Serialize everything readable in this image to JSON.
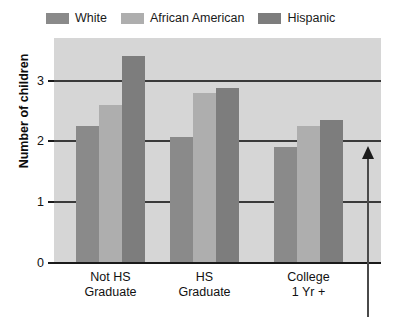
{
  "chart_data": {
    "type": "bar",
    "title": "",
    "subtitle": "",
    "xlabel": "",
    "ylabel": "Number of children",
    "categories": [
      "Not HS Graduate",
      "HS Graduate",
      "College 1 Yr +"
    ],
    "category_lines": [
      [
        "Not HS",
        "Graduate"
      ],
      [
        "HS",
        "Graduate"
      ],
      [
        "College",
        "1 Yr +"
      ]
    ],
    "series": [
      {
        "name": "White",
        "color": "#8a8a8a",
        "values": [
          2.25,
          2.08,
          1.9
        ]
      },
      {
        "name": "African American",
        "color": "#aeaeae",
        "values": [
          2.6,
          2.8,
          2.25
        ]
      },
      {
        "name": "Hispanic",
        "color": "#7d7d7d",
        "values": [
          3.4,
          2.87,
          2.35
        ]
      }
    ],
    "ylim": [
      0,
      3.7
    ],
    "yticks": [
      0,
      1,
      2,
      3
    ],
    "ytick_labels": [
      "0",
      "1",
      "2",
      "3"
    ],
    "grid": true,
    "grid_orientation": "horizontal",
    "legend_position": "top-left",
    "plot_background": "#d6d6d6",
    "annotations": [
      {
        "name": "upward-arrow",
        "type": "arrow",
        "direction": "up",
        "x_px": 368,
        "y_tip_px": 146,
        "y_tail_px": 317
      }
    ]
  },
  "legend": {
    "entries": [
      {
        "label": "White"
      },
      {
        "label": "African American"
      },
      {
        "label": "Hispanic"
      }
    ]
  },
  "axes": {
    "y_title": "Number of children",
    "y_tick_labels": [
      "3",
      "2",
      "1",
      "0"
    ]
  }
}
